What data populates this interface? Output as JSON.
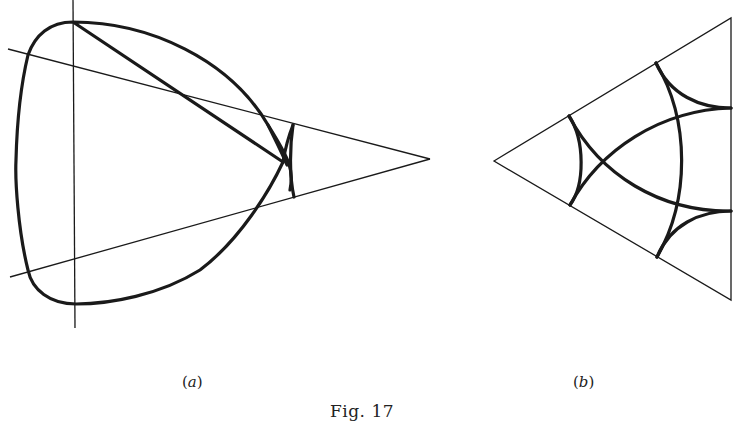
{
  "figure": {
    "caption": "Fig. 17",
    "panels": [
      {
        "id": "a",
        "label_open": "(",
        "label_letter": "a",
        "label_close": ")"
      },
      {
        "id": "b",
        "label_open": "(",
        "label_letter": "b",
        "label_close": ")"
      }
    ]
  },
  "colors": {
    "ink": "#1a1a1a",
    "background": "#ffffff"
  }
}
